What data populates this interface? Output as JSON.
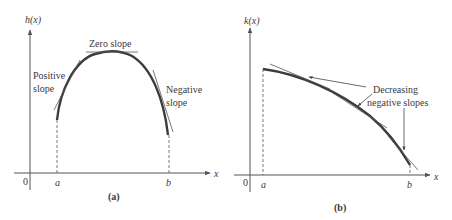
{
  "panel_a": {
    "y_axis_label": "h(x)",
    "x_axis_label": "x",
    "origin_label": "0",
    "a_label": "a",
    "b_label": "b",
    "caption": "(a)",
    "annotations": {
      "zero_slope": "Zero slope",
      "positive_line1": "Positive",
      "positive_line2": "slope",
      "negative_line1": "Negative",
      "negative_line2": "slope"
    }
  },
  "panel_b": {
    "y_axis_label": "k(x)",
    "x_axis_label": "x",
    "origin_label": "0",
    "a_label": "a",
    "b_label": "b",
    "caption": "(b)",
    "annotations": {
      "line1": "Decreasing",
      "line2": "negative slopes"
    }
  },
  "colors": {
    "curve": "#3c3c3c",
    "axis": "#555555",
    "text": "#3a3a3a"
  }
}
